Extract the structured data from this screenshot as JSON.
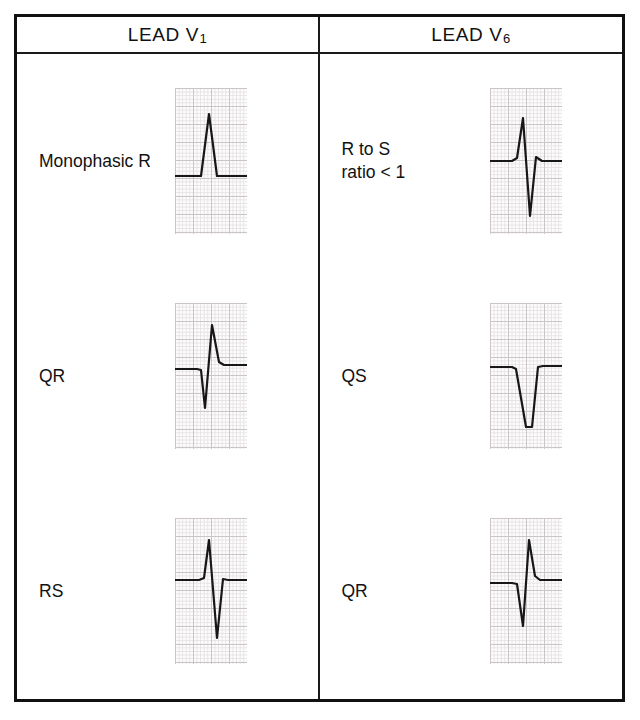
{
  "figure": {
    "kind": "ecg-morphology-reference-table",
    "columns": [
      {
        "key": "v1",
        "title": "LEAD V",
        "subscript": "1"
      },
      {
        "key": "v6",
        "title": "LEAD V",
        "subscript": "6"
      }
    ],
    "rows": [
      {
        "v1": {
          "label": "Monophasic R",
          "waveform": "monophasic-r",
          "description": "Single tall upright R wave, no negative deflection",
          "baseline_pct": 40,
          "r_amplitude": 30,
          "s_amplitude": 0
        },
        "v6": {
          "label": "R to S\nratio < 1",
          "waveform": "rs-ratio-less-than-1",
          "description": "Small R wave followed by deeper S wave",
          "baseline_pct": 50,
          "r_amplitude": 32,
          "s_amplitude": 46
        }
      },
      {
        "v1": {
          "label": "QR",
          "waveform": "qr",
          "description": "Small initial q deflection then tall R wave",
          "baseline_pct": 45,
          "q_amplitude": 34,
          "r_amplitude": 40
        },
        "v6": {
          "label": "QS",
          "waveform": "qs",
          "description": "Entirely negative QS complex",
          "baseline_pct": 42,
          "q_amplitude": 52,
          "r_amplitude": 0
        }
      },
      {
        "v1": {
          "label": "RS",
          "waveform": "rs",
          "description": "Tall R wave followed by deep S wave",
          "baseline_pct": 42,
          "r_amplitude": 38,
          "s_amplitude": 46
        },
        "v6": {
          "label": "QR",
          "waveform": "qr",
          "description": "Small initial q deflection then tall R wave",
          "baseline_pct": 45,
          "q_amplitude": 36,
          "r_amplitude": 42
        }
      }
    ],
    "colors": {
      "border": "#111111",
      "text": "#111111",
      "trace": "#171717",
      "grid_major": "#c9c2c6",
      "grid_minor": "#e6e1e4",
      "strip_background": "#fdfdfd",
      "page_background": "#ffffff"
    }
  },
  "traces": {
    "monophasic-r": "M0,88 L26,88 L34,26 L42,88 L72,88",
    "rs-ratio-less-than-1": "M0,73 L22,73 L27,70 L33,30 L40,128 L46,69 L52,73 L72,73",
    "qr": "M0,66 L22,66 L26,67 L30,105 L37,22 L44,59 L49,62 L72,62",
    "qs": "M0,64 L22,64 L26,66 L36,124 L42,124 L48,64 L53,63 L72,63",
    "rs": "M0,62 L24,62 L29,60 L34,22 L42,120 L48,61 L53,62 L72,62",
    "qr-v6": "M0,65 L22,65 L27,66 L33,108 L39,22 L45,58 L50,62 L72,62"
  }
}
